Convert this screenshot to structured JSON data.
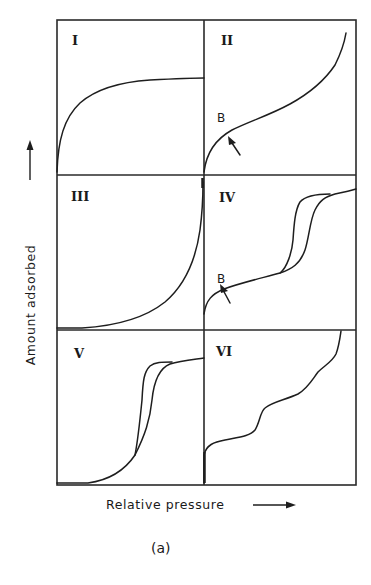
{
  "figure": {
    "caption": "(a)",
    "y_axis_label": "Amount adsorbed",
    "x_axis_label": "Relative pressure",
    "point_label": "B",
    "panels": [
      {
        "id": "I",
        "label": "I",
        "description": "Type I isotherm - rapid rise then plateau (Langmuir)"
      },
      {
        "id": "II",
        "label": "II",
        "description": "Type II isotherm - knee at point B, then steady rise"
      },
      {
        "id": "III",
        "label": "III",
        "description": "Type III isotherm - convex to pressure axis throughout"
      },
      {
        "id": "IV",
        "label": "IV",
        "description": "Type IV isotherm - knee at point B, hysteresis loop, plateau"
      },
      {
        "id": "V",
        "label": "V",
        "description": "Type V isotherm - convex start, hysteresis loop, plateau"
      },
      {
        "id": "VI",
        "label": "VI",
        "description": "Type VI isotherm - stepwise multilayer adsorption"
      }
    ],
    "colors": {
      "ink": "#1e1e1e",
      "background": "#ffffff"
    }
  }
}
